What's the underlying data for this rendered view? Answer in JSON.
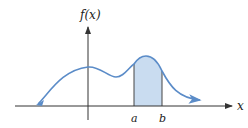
{
  "diagram": {
    "y_axis_label": "f(x)",
    "x_axis_label": "x",
    "bound_lower_label": "a",
    "bound_upper_label": "b",
    "colors": {
      "curve": "#5b8cc8",
      "shade": "#c9dcf0",
      "axis": "#333333",
      "text": "#222222"
    }
  }
}
